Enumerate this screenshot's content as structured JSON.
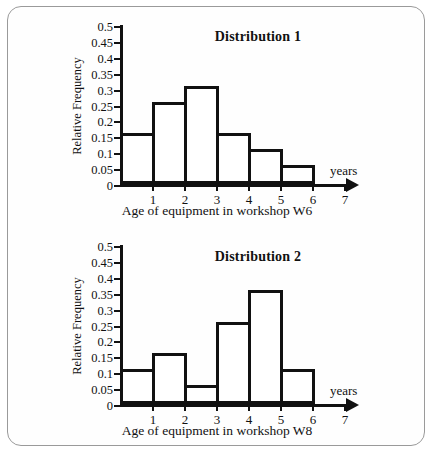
{
  "figure": {
    "border_color": "#9a9a9a",
    "background": "#fefefe",
    "ink_color": "#111111"
  },
  "chart_data": [
    {
      "type": "bar",
      "title": "Distribution 1",
      "xlabel": "Age of equipment in workshop W6",
      "ylabel": "Relative Frequency",
      "x_axis_unit_label": "years",
      "categories": [
        "0-1",
        "1-2",
        "2-3",
        "3-4",
        "4-5",
        "5-6"
      ],
      "bin_edges": [
        0,
        1,
        2,
        3,
        4,
        5,
        6
      ],
      "values": [
        0.15,
        0.25,
        0.3,
        0.15,
        0.1,
        0.05
      ],
      "xlim": [
        0,
        7
      ],
      "ylim": [
        0,
        0.5
      ],
      "xticks": [
        "1",
        "2",
        "3",
        "4",
        "5",
        "6",
        "7"
      ],
      "yticks": [
        "0",
        "0.05",
        "0.1",
        "0.15",
        "0.2",
        "0.25",
        "0.3",
        "0.35",
        "0.4",
        "0.45",
        "0.5"
      ],
      "grid": false,
      "legend": false
    },
    {
      "type": "bar",
      "title": "Distribution 2",
      "xlabel": "Age of equipment in workshop W8",
      "ylabel": "Relative Frequency",
      "x_axis_unit_label": "years",
      "categories": [
        "0-1",
        "1-2",
        "2-3",
        "3-4",
        "4-5",
        "5-6"
      ],
      "bin_edges": [
        0,
        1,
        2,
        3,
        4,
        5,
        6
      ],
      "values": [
        0.1,
        0.15,
        0.05,
        0.25,
        0.35,
        0.1
      ],
      "xlim": [
        0,
        7
      ],
      "ylim": [
        0,
        0.5
      ],
      "xticks": [
        "1",
        "2",
        "3",
        "4",
        "5",
        "6",
        "7"
      ],
      "yticks": [
        "0",
        "0.05",
        "0.1",
        "0.15",
        "0.2",
        "0.25",
        "0.3",
        "0.35",
        "0.4",
        "0.45",
        "0.5"
      ],
      "grid": false,
      "legend": false
    }
  ]
}
